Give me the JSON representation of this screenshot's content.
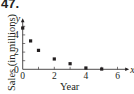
{
  "problem": {
    "number": "47."
  },
  "chart_data": {
    "type": "scatter",
    "title": "",
    "xlabel": "Year",
    "ylabel": "Sales (in millions)",
    "x_axis_symbol": "x",
    "y_axis_symbol": "y",
    "x_ticks": [
      "0",
      "2",
      "4",
      "6"
    ],
    "y_ticks": [
      "0",
      "2",
      "4"
    ],
    "xlim": [
      0,
      6.5
    ],
    "ylim": [
      0,
      5.5
    ],
    "grid": false,
    "legend": null,
    "marker": "square",
    "color": "#231f20",
    "x": [
      0,
      0.5,
      1,
      2,
      3,
      4,
      5
    ],
    "y": [
      4.8,
      3.3,
      2.2,
      1.2,
      0.65,
      0.15,
      0.03
    ]
  }
}
